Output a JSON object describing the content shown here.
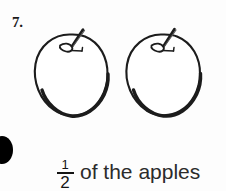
{
  "item": {
    "number_label": "7.",
    "bullet_icon": "filled-circle-bullet"
  },
  "figures": {
    "count_label": "2",
    "items": [
      {
        "name": "apple-outline-drawing",
        "alt": "apple"
      },
      {
        "name": "apple-outline-drawing",
        "alt": "apple"
      }
    ]
  },
  "answer": {
    "fraction": {
      "numerator": "1",
      "denominator": "2"
    },
    "text": "of the apples"
  },
  "colors": {
    "ink": "#1a1a1a",
    "background": "#fdfdfd",
    "bullet": "#000000"
  }
}
